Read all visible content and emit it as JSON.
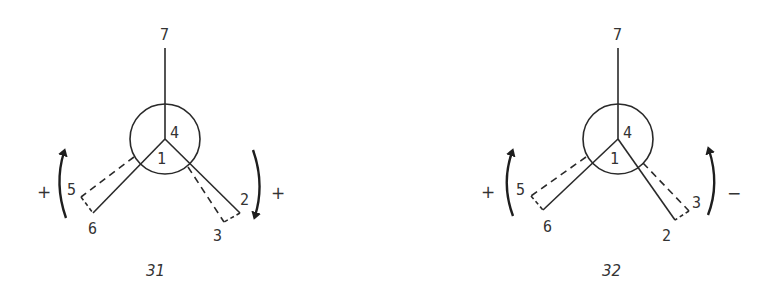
{
  "figures": [
    {
      "caption": "31",
      "labels": {
        "top": "7",
        "center_upper": "4",
        "center_lower": "1",
        "left_dashed": "5",
        "left_solid": "6",
        "right_solid": "2",
        "right_dashed": "3"
      },
      "left_rotation": {
        "sign": "+",
        "arrow": "up"
      },
      "right_rotation": {
        "sign": "+",
        "arrow": "down"
      }
    },
    {
      "caption": "32",
      "labels": {
        "top": "7",
        "center_upper": "4",
        "center_lower": "1",
        "left_dashed": "5",
        "left_solid": "6",
        "right_solid": "2",
        "right_dashed": "3"
      },
      "left_rotation": {
        "sign": "+",
        "arrow": "up"
      },
      "right_rotation": {
        "sign": "−",
        "arrow": "up"
      }
    }
  ],
  "colors": {
    "ink": "#2a2a2a",
    "background": "#ffffff"
  }
}
